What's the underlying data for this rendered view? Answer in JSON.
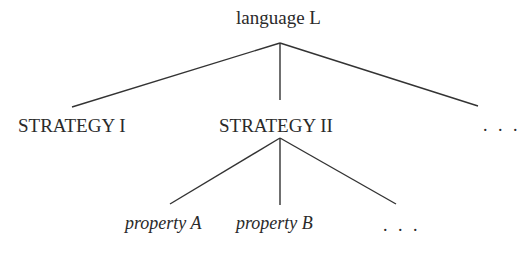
{
  "diagram": {
    "type": "tree",
    "root": {
      "label": "language L",
      "children": [
        {
          "label": "STRATEGY I"
        },
        {
          "label": "STRATEGY II",
          "children": [
            {
              "label": "property A"
            },
            {
              "label": "property B"
            },
            {
              "label": ". . ."
            }
          ]
        },
        {
          "label": ". . ."
        }
      ]
    },
    "line_color": "#333333"
  }
}
